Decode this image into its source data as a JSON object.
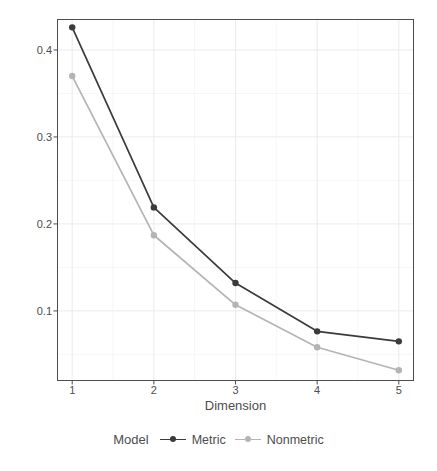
{
  "chart_data": {
    "type": "line",
    "title": "",
    "subtitle": "",
    "xlabel": "Dimension",
    "ylabel": "Stress",
    "x": [
      1,
      2,
      3,
      4,
      5
    ],
    "categories": [
      "1",
      "2",
      "3",
      "4",
      "5"
    ],
    "xtick_labels": [
      "1",
      "2",
      "3",
      "4",
      "5"
    ],
    "ytick_labels": [
      "0.1",
      "0.2",
      "0.3",
      "0.4"
    ],
    "ytick_values": [
      0.1,
      0.2,
      0.3,
      0.4
    ],
    "xlim": [
      0.82,
      5.18
    ],
    "ylim": [
      0.02,
      0.435
    ],
    "grid": true,
    "legend_position": "bottom",
    "legend_title": "Model",
    "series": [
      {
        "name": "Metric",
        "color": "#3b3b3b",
        "values": [
          0.426,
          0.219,
          0.132,
          0.0765,
          0.065
        ]
      },
      {
        "name": "Nonmetric",
        "color": "#b4b4b4",
        "values": [
          0.37,
          0.187,
          0.107,
          0.0582,
          0.0318
        ]
      }
    ]
  },
  "axes": {
    "y_title": "Stress",
    "x_title": "Dimension"
  },
  "legend": {
    "title": "Model",
    "items": [
      {
        "label": "Metric",
        "color": "#3b3b3b"
      },
      {
        "label": "Nonmetric",
        "color": "#b4b4b4"
      }
    ]
  },
  "colors": {
    "panel_border": "#4d4d4d",
    "gridline": "#ebebeb",
    "text": "#4d4d4d",
    "background": "#ffffff"
  }
}
